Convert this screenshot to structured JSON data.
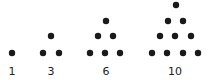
{
  "dot_color": "#1a1a1a",
  "dot_radius": 3.2,
  "groups": [
    {
      "label": "1",
      "label_x": 12,
      "dots": [
        [
          12,
          53
        ]
      ]
    },
    {
      "label": "3",
      "label_x": 51,
      "dots": [
        [
          51,
          36
        ],
        [
          43,
          53
        ],
        [
          59,
          53
        ]
      ]
    },
    {
      "label": "6",
      "label_x": 106,
      "dots": [
        [
          106,
          21
        ],
        [
          98,
          36
        ],
        [
          113,
          36
        ],
        [
          90,
          53
        ],
        [
          105,
          53
        ],
        [
          120,
          53
        ]
      ]
    },
    {
      "label": "10",
      "label_x": 175,
      "dots": [
        [
          176,
          5
        ],
        [
          168,
          21
        ],
        [
          183,
          21
        ],
        [
          160,
          36
        ],
        [
          175,
          36
        ],
        [
          191,
          36
        ],
        [
          152,
          53
        ],
        [
          167,
          53
        ],
        [
          183,
          53
        ],
        [
          198,
          53
        ]
      ]
    }
  ]
}
